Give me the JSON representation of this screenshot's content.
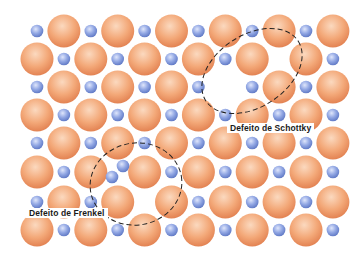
{
  "diagram": {
    "grid": {
      "columns": 12,
      "rows": 8,
      "x0": 37,
      "dx": 26.9,
      "row_y": [
        31,
        59,
        87,
        115,
        143,
        172,
        202,
        230
      ],
      "large_radius": 16.5,
      "small_radius": 6.3,
      "rule": "large ion where (row+col) is odd, small ion where even"
    },
    "colors": {
      "large_light": "#fbd9bf",
      "large_mid": "#f3a878",
      "large_dark": "#e07c4c",
      "small_light": "#dfe6fb",
      "small_mid": "#93a8e4",
      "small_dark": "#5a74c2",
      "dash": "#222222"
    },
    "vacancies": [
      {
        "row": 1,
        "col": 9,
        "type": "small"
      },
      {
        "row": 2,
        "col": 7,
        "type": "large"
      },
      {
        "row": 6,
        "col": 4,
        "type": "small"
      },
      {
        "row": 5,
        "col": 3,
        "type": "small"
      }
    ],
    "extra_ions": [
      {
        "x": 123,
        "y": 166,
        "type": "small"
      },
      {
        "x": 112,
        "y": 177,
        "type": "small"
      }
    ],
    "defects": [
      {
        "id": "schottky",
        "label": "Defeito de Schottky",
        "outline": {
          "cx": 252,
          "cy": 71,
          "rx": 55,
          "ry": 36,
          "rotate": -33
        }
      },
      {
        "id": "frenkel",
        "label": "Defeito de Frenkel",
        "outline": {
          "cx": 136,
          "cy": 184,
          "rx": 46,
          "ry": 41,
          "rotate": -10
        }
      }
    ]
  }
}
